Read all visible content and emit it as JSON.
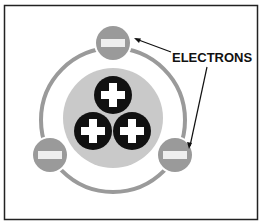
{
  "diagram": {
    "label": "ELECTRONS",
    "colors": {
      "frame": "#222222",
      "orbit": "#9a9a9a",
      "nucleus": "#c9c9c9",
      "electron": "#9a9a9a",
      "proton": "#111111",
      "sign": "#ffffff"
    },
    "nucleus": {
      "cx": 113,
      "cy": 118,
      "r": 50
    },
    "orbit": {
      "cx": 113,
      "cy": 120,
      "r": 72
    },
    "protons": [
      {
        "cx": 113,
        "cy": 95,
        "sign": "+"
      },
      {
        "cx": 93,
        "cy": 131,
        "sign": "+"
      },
      {
        "cx": 132,
        "cy": 131,
        "sign": "+"
      }
    ],
    "electrons": [
      {
        "cx": 113,
        "cy": 43,
        "sign": "−"
      },
      {
        "cx": 50,
        "cy": 155,
        "sign": "−"
      },
      {
        "cx": 175,
        "cy": 155,
        "sign": "−"
      }
    ]
  }
}
